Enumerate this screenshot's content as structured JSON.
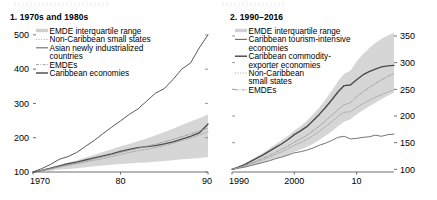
{
  "figure": {
    "background_color": "#ffffff",
    "text_color": "#000000"
  },
  "panels": [
    {
      "id": "panel-1",
      "title": "1. 1970s and 1980s",
      "y_ticks": [
        "500",
        "400",
        "300",
        "200",
        "100"
      ],
      "x_ticks": [
        "1970",
        "80",
        "90"
      ],
      "y_axis_side": "left",
      "legend": [
        {
          "label": "EMDE interquartile range",
          "marker": "band",
          "color": "#c8c8c8"
        },
        {
          "label": "Non-Caribbean small states",
          "marker": "dotted",
          "color": "#8a8a8a"
        },
        {
          "label": "Asian newly industrialized countries",
          "marker": "solid",
          "color": "#555555"
        },
        {
          "label": "EMDEs",
          "marker": "dashdot",
          "color": "#8a8a8a"
        },
        {
          "label": "Caribbean economies",
          "marker": "solid-dark",
          "color": "#4a4a4a"
        }
      ]
    },
    {
      "id": "panel-2",
      "title": "2. 1990–2016",
      "y_ticks": [
        "350",
        "300",
        "250",
        "200",
        "150",
        "100"
      ],
      "x_ticks": [
        "1990",
        "2000",
        "10"
      ],
      "y_axis_side": "right",
      "legend": [
        {
          "label": "EMDE interquartile range",
          "marker": "band",
          "color": "#c8c8c8"
        },
        {
          "label": "Caribbean tourism-intensive economies",
          "marker": "solid",
          "color": "#6b6b6b"
        },
        {
          "label": "Caribbean commodity-exporter economies",
          "marker": "solid-dark",
          "color": "#3f3f3f"
        },
        {
          "label": "Non-Caribbean small states",
          "marker": "dotted",
          "color": "#9a9a9a"
        },
        {
          "label": "EMDEs",
          "marker": "dashdot",
          "color": "#9a9a9a"
        }
      ]
    }
  ],
  "chart_data": [
    {
      "type": "line",
      "panel": "1. 1970s and 1980s",
      "title": "1. 1970s and 1980s",
      "xlabel": "",
      "ylabel": "",
      "index_note": "Index, 1970 = 100",
      "xlim": [
        1970,
        1990
      ],
      "ylim": [
        100,
        520
      ],
      "ytick_values": [
        100,
        200,
        300,
        400,
        500
      ],
      "xtick_values": [
        1970,
        1980,
        1990
      ],
      "xtick_labels": [
        "1970",
        "80",
        "90"
      ],
      "grid": false,
      "legend_position": "upper-left",
      "x": [
        1970,
        1971,
        1972,
        1973,
        1974,
        1975,
        1976,
        1977,
        1978,
        1979,
        1980,
        1981,
        1982,
        1983,
        1984,
        1985,
        1986,
        1987,
        1988,
        1989,
        1990
      ],
      "band": {
        "name": "EMDE interquartile range",
        "lower": [
          100,
          102,
          104,
          107,
          109,
          111,
          114,
          117,
          119,
          121,
          123,
          125,
          127,
          128,
          130,
          132,
          134,
          137,
          139,
          141,
          144
        ],
        "upper": [
          100,
          106,
          112,
          120,
          127,
          134,
          142,
          150,
          158,
          166,
          175,
          182,
          190,
          198,
          207,
          216,
          226,
          237,
          247,
          257,
          268
        ]
      },
      "series": [
        {
          "name": "Asian newly industrialized countries",
          "values": [
            100,
            110,
            122,
            137,
            145,
            157,
            175,
            192,
            212,
            231,
            249,
            268,
            284,
            307,
            330,
            343,
            370,
            400,
            418,
            462,
            500
          ]
        },
        {
          "name": "Caribbean economies",
          "values": [
            100,
            105,
            111,
            118,
            124,
            129,
            135,
            141,
            147,
            153,
            160,
            166,
            171,
            174,
            177,
            182,
            188,
            196,
            204,
            214,
            240
          ]
        },
        {
          "name": "Non-Caribbean small states",
          "values": [
            100,
            104,
            109,
            114,
            119,
            124,
            129,
            134,
            139,
            145,
            151,
            157,
            162,
            166,
            171,
            177,
            184,
            191,
            199,
            208,
            218
          ]
        },
        {
          "name": "EMDEs",
          "values": [
            100,
            105,
            110,
            116,
            121,
            126,
            132,
            138,
            144,
            150,
            157,
            163,
            169,
            175,
            181,
            188,
            195,
            203,
            211,
            219,
            228
          ]
        }
      ]
    },
    {
      "type": "line",
      "panel": "2. 1990–2016",
      "title": "2. 1990–2016",
      "xlabel": "",
      "ylabel": "",
      "index_note": "Index, 1990 = 100",
      "xlim": [
        1990,
        2016
      ],
      "ylim": [
        95,
        365
      ],
      "ytick_values": [
        100,
        150,
        200,
        250,
        300,
        350
      ],
      "xtick_values": [
        1990,
        2000,
        2010
      ],
      "xtick_labels": [
        "1990",
        "2000",
        "10"
      ],
      "grid": false,
      "legend_position": "upper-left",
      "x": [
        1990,
        1991,
        1992,
        1993,
        1994,
        1995,
        1996,
        1997,
        1998,
        1999,
        2000,
        2001,
        2002,
        2003,
        2004,
        2005,
        2006,
        2007,
        2008,
        2009,
        2010,
        2011,
        2012,
        2013,
        2014,
        2015,
        2016
      ],
      "band": {
        "name": "EMDE interquartile range",
        "lower": [
          100,
          102,
          104,
          107,
          110,
          113,
          117,
          121,
          124,
          128,
          133,
          137,
          142,
          148,
          155,
          163,
          171,
          181,
          189,
          194,
          203,
          211,
          218,
          225,
          232,
          238,
          244
        ],
        "upper": [
          100,
          105,
          110,
          117,
          124,
          131,
          139,
          147,
          155,
          163,
          173,
          181,
          191,
          203,
          216,
          231,
          247,
          265,
          279,
          285,
          302,
          316,
          327,
          337,
          345,
          351,
          356
        ]
      },
      "series": [
        {
          "name": "Caribbean commodity-exporter economies",
          "values": [
            100,
            104,
            109,
            115,
            121,
            127,
            134,
            141,
            148,
            156,
            165,
            172,
            180,
            191,
            203,
            216,
            230,
            245,
            257,
            258,
            268,
            277,
            283,
            288,
            292,
            294,
            295
          ]
        },
        {
          "name": "Caribbean tourism-intensive economies",
          "values": [
            100,
            102,
            104,
            107,
            110,
            113,
            116,
            120,
            123,
            127,
            131,
            133,
            136,
            140,
            145,
            149,
            154,
            160,
            162,
            157,
            158,
            160,
            161,
            164,
            162,
            165,
            166
          ]
        },
        {
          "name": "Non-Caribbean small states",
          "values": [
            100,
            103,
            106,
            110,
            114,
            118,
            123,
            128,
            133,
            139,
            145,
            150,
            156,
            163,
            171,
            180,
            189,
            199,
            207,
            208,
            216,
            223,
            229,
            235,
            240,
            245,
            249
          ]
        },
        {
          "name": "EMDEs",
          "values": [
            100,
            103,
            107,
            111,
            116,
            121,
            126,
            132,
            138,
            144,
            151,
            157,
            164,
            172,
            181,
            191,
            201,
            212,
            221,
            225,
            236,
            245,
            253,
            261,
            268,
            274,
            280
          ]
        }
      ]
    }
  ]
}
